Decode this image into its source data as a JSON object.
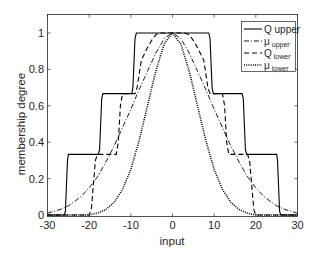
{
  "chart_data": {
    "type": "line",
    "title": "",
    "xlabel": "input",
    "ylabel": "membership degree",
    "xlim": [
      -30,
      30
    ],
    "ylim": [
      0,
      1.1
    ],
    "xticks": [
      -30,
      -20,
      -10,
      0,
      10,
      20,
      30
    ],
    "xtick_labels": [
      "-30",
      "-20",
      "-10",
      "0",
      "10",
      "20",
      "30"
    ],
    "yticks": [
      0,
      0.2,
      0.4,
      0.6,
      0.8,
      1
    ],
    "ytick_labels": [
      "0",
      "0.2",
      "0.4",
      "0.6",
      "0.8",
      "1"
    ],
    "grid": false,
    "legend_position": "upper right",
    "series": [
      {
        "name": "Q upper",
        "legend_main": "Q upper",
        "legend_sub": "",
        "style": "solid",
        "x": [
          -30,
          -26,
          -25.7,
          -25.2,
          -25,
          -17.8,
          -17.5,
          -17,
          -16.7,
          -9.8,
          -9.5,
          -9,
          -8.7,
          0,
          8.7,
          9,
          9.5,
          9.8,
          16.7,
          17,
          17.5,
          17.8,
          25,
          25.2,
          25.7,
          26,
          30
        ],
        "values": [
          0.0,
          0.0,
          0.02,
          0.3,
          0.333,
          0.333,
          0.36,
          0.64,
          0.667,
          0.667,
          0.7,
          0.97,
          1.0,
          1.0,
          1.0,
          0.97,
          0.7,
          0.667,
          0.667,
          0.64,
          0.36,
          0.333,
          0.333,
          0.3,
          0.02,
          0.0,
          0.0
        ]
      },
      {
        "name": "mu upper",
        "legend_main": "μ",
        "legend_sub": "upper",
        "style": "dashdot",
        "x": [
          -30,
          -27,
          -25,
          -22,
          -20,
          -18,
          -16,
          -14,
          -12,
          -10,
          -8,
          -6,
          -4,
          -2,
          0,
          2,
          4,
          6,
          8,
          10,
          12,
          14,
          16,
          18,
          20,
          22,
          25,
          27,
          30
        ],
        "values": [
          0.01,
          0.03,
          0.05,
          0.1,
          0.15,
          0.21,
          0.29,
          0.38,
          0.48,
          0.58,
          0.69,
          0.79,
          0.89,
          0.97,
          1.0,
          0.97,
          0.89,
          0.79,
          0.69,
          0.58,
          0.48,
          0.38,
          0.29,
          0.21,
          0.15,
          0.1,
          0.05,
          0.03,
          0.01
        ]
      },
      {
        "name": "Q lower",
        "legend_main": "Q",
        "legend_sub": "lower",
        "style": "dashed",
        "x": [
          -30,
          -20,
          -19.5,
          -18.5,
          -18,
          -13.5,
          -13,
          -12.5,
          -12,
          -9,
          -8.5,
          -7.5,
          -6,
          -5,
          -4,
          -3,
          0,
          3,
          4,
          5,
          6,
          7.5,
          8.5,
          9,
          12,
          12.5,
          13,
          13.5,
          18,
          18.5,
          19.5,
          20,
          30
        ],
        "values": [
          0.0,
          0.0,
          0.03,
          0.3,
          0.333,
          0.333,
          0.4,
          0.6,
          0.667,
          0.667,
          0.7,
          0.85,
          0.92,
          0.96,
          0.99,
          1.0,
          1.0,
          1.0,
          0.99,
          0.96,
          0.92,
          0.85,
          0.7,
          0.667,
          0.667,
          0.6,
          0.4,
          0.333,
          0.333,
          0.3,
          0.03,
          0.0,
          0.0
        ]
      },
      {
        "name": "mu lower",
        "legend_main": "μ",
        "legend_sub": "lower",
        "style": "dotted",
        "x": [
          -30,
          -20,
          -18,
          -16,
          -14,
          -12,
          -10,
          -8,
          -6,
          -4,
          -2,
          0,
          2,
          4,
          6,
          8,
          10,
          12,
          14,
          16,
          18,
          20,
          30
        ],
        "values": [
          0.0,
          0.0,
          0.01,
          0.03,
          0.07,
          0.14,
          0.25,
          0.41,
          0.6,
          0.79,
          0.94,
          1.0,
          0.94,
          0.79,
          0.6,
          0.41,
          0.25,
          0.14,
          0.07,
          0.03,
          0.01,
          0.0,
          0.0
        ]
      }
    ]
  },
  "colors": {
    "axis": "#262626",
    "line": "#000000",
    "background": "#ffffff"
  }
}
